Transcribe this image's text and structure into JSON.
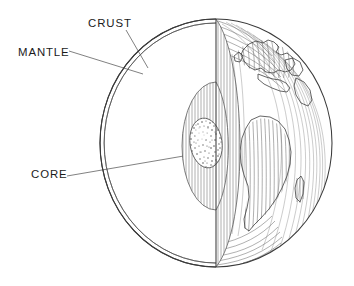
{
  "figure": {
    "background_color": "#ffffff",
    "ink_color": "#3a3a3a",
    "label_color": "#1b1b1b",
    "style": "pen-and-ink line drawing with vertical hatching and stippling"
  },
  "labels": {
    "crust": "CRUST",
    "mantle": "MANTLE",
    "core": "CORE"
  },
  "layers": [
    {
      "name": "crust",
      "label": "CRUST",
      "description": "Thin double-line outer shell of the sphere",
      "label_x": 88,
      "label_y": 27,
      "leader_from": [
        126,
        30
      ],
      "leader_to": [
        147,
        67
      ]
    },
    {
      "name": "mantle",
      "label": "MANTLE",
      "description": "Vertically hatched region between crust and core",
      "label_x": 18,
      "label_y": 56,
      "leader_from": [
        69,
        51
      ],
      "leader_to": [
        142,
        73
      ]
    },
    {
      "name": "core",
      "label": "CORE",
      "description": "Stippled oval sphere at the centre",
      "label_x": 31,
      "label_y": 178,
      "leader_from": [
        67,
        176
      ],
      "leader_to": [
        206,
        152
      ]
    }
  ],
  "globe": {
    "center_x": 216,
    "center_y": 143,
    "radius_x": 116,
    "radius_y": 124,
    "cut_plane_x": 216,
    "continents_visible": [
      "Europe",
      "Africa",
      "Arabia",
      "Madagascar",
      "Mediterranean Sea"
    ],
    "inner_shell": {
      "name": "mantle-boundary",
      "left_x": 150,
      "top_y": 82,
      "bottom_y": 210
    },
    "core_body": {
      "center_x": 206,
      "center_y": 143,
      "radius_x": 16,
      "radius_y": 25
    }
  }
}
